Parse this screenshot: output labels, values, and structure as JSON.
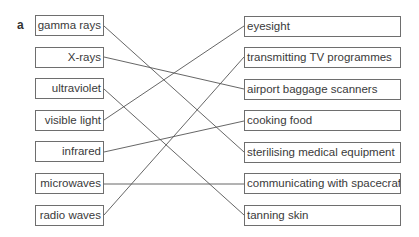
{
  "label": "a",
  "left_items": [
    "gamma rays",
    "X-rays",
    "ultraviolet",
    "visible light",
    "infrared",
    "microwaves",
    "radio waves"
  ],
  "right_items": [
    "eyesight",
    "transmitting TV programmes",
    "airport baggage scanners",
    "cooking food",
    "sterilising medical equipment",
    "communicating with spacecraft",
    "tanning skin"
  ],
  "matches": [
    {
      "left": "gamma rays",
      "right": "sterilising medical equipment"
    },
    {
      "left": "X-rays",
      "right": "airport baggage scanners"
    },
    {
      "left": "ultraviolet",
      "right": "tanning skin"
    },
    {
      "left": "visible light",
      "right": "eyesight"
    },
    {
      "left": "infrared",
      "right": "cooking food"
    },
    {
      "left": "microwaves",
      "right": "communicating with spacecraft"
    },
    {
      "left": "radio waves",
      "right": "transmitting TV programmes"
    }
  ]
}
